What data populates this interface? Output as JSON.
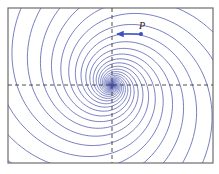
{
  "diagram": {
    "type": "phase-portrait",
    "frame": {
      "x": 8,
      "y": 8,
      "width": 205,
      "height": 155
    },
    "origin": {
      "x": 112,
      "y": 85
    },
    "spiral": {
      "arm_count": 12,
      "decay_rate": 0.32,
      "direction": "counterclockwise-inward",
      "color": "#5560b0"
    },
    "axes": {
      "style": "dashed",
      "color": "#3a3a3a"
    },
    "point": {
      "label": "P",
      "x": 141,
      "y": 34,
      "color": "#3b4fc4"
    },
    "velocity_vector": {
      "from": {
        "x": 141,
        "y": 34
      },
      "to": {
        "x": 116,
        "y": 34
      },
      "direction": "left",
      "color": "#3b4fc4"
    }
  }
}
